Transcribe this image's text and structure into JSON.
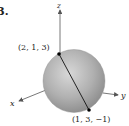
{
  "problem_number": "3.",
  "axes": {
    "x_label": "x",
    "y_label": "y",
    "z_label": "z"
  },
  "points": [
    {
      "label": "(2, 1, 3)",
      "coords": [
        2,
        1,
        3
      ]
    },
    {
      "label": "(1, 3, −1)",
      "coords": [
        1,
        3,
        -1
      ]
    }
  ],
  "sphere": {
    "fill": "#a8a8a8",
    "highlight": "#d6d6d6",
    "edge": "#8a8a8a"
  },
  "colors": {
    "axis": "#555555",
    "segment": "#111111",
    "point": "#000000"
  }
}
